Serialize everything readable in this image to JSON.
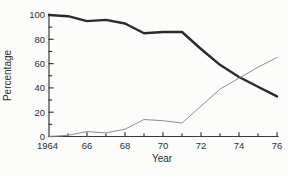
{
  "figure": {
    "background": "#fcfcfa"
  },
  "chart_data": {
    "type": "line",
    "title": "",
    "xlabel": "Year",
    "ylabel": "Percentage",
    "xlim": [
      1964,
      1976
    ],
    "ylim": [
      0,
      100
    ],
    "x_major_ticks": [
      1964,
      1966,
      1968,
      1970,
      1972,
      1974,
      1976
    ],
    "x_tick_labels": [
      "1964",
      "66",
      "68",
      "70",
      "72",
      "74",
      "76"
    ],
    "x_minor_ticks": [
      1965,
      1967,
      1969,
      1971,
      1973,
      1975
    ],
    "y_major_ticks": [
      0,
      20,
      40,
      60,
      80,
      100
    ],
    "y_tick_labels": [
      "0",
      "20",
      "40",
      "60",
      "80",
      "100"
    ],
    "y_minor_ticks": [
      10,
      30,
      50,
      70,
      90
    ],
    "grid": false,
    "legend": "none",
    "x": [
      1964,
      1965,
      1966,
      1967,
      1968,
      1969,
      1970,
      1971,
      1972,
      1973,
      1974,
      1975,
      1976
    ],
    "series": [
      {
        "name": "declining-series-thick",
        "color": "#2b2b2b",
        "stroke_width": 2.4,
        "values": [
          100,
          99,
          95,
          96,
          93,
          85,
          86,
          86,
          72,
          59,
          49,
          41,
          33
        ]
      },
      {
        "name": "rising-series-thin",
        "color": "#8e8e8e",
        "stroke_width": 1,
        "values": [
          0,
          1,
          4,
          3,
          6,
          14,
          13,
          11,
          25,
          39,
          48,
          57,
          65
        ]
      }
    ],
    "axis_color": "#3a3a3a",
    "text_color": "#2f2f2f"
  }
}
